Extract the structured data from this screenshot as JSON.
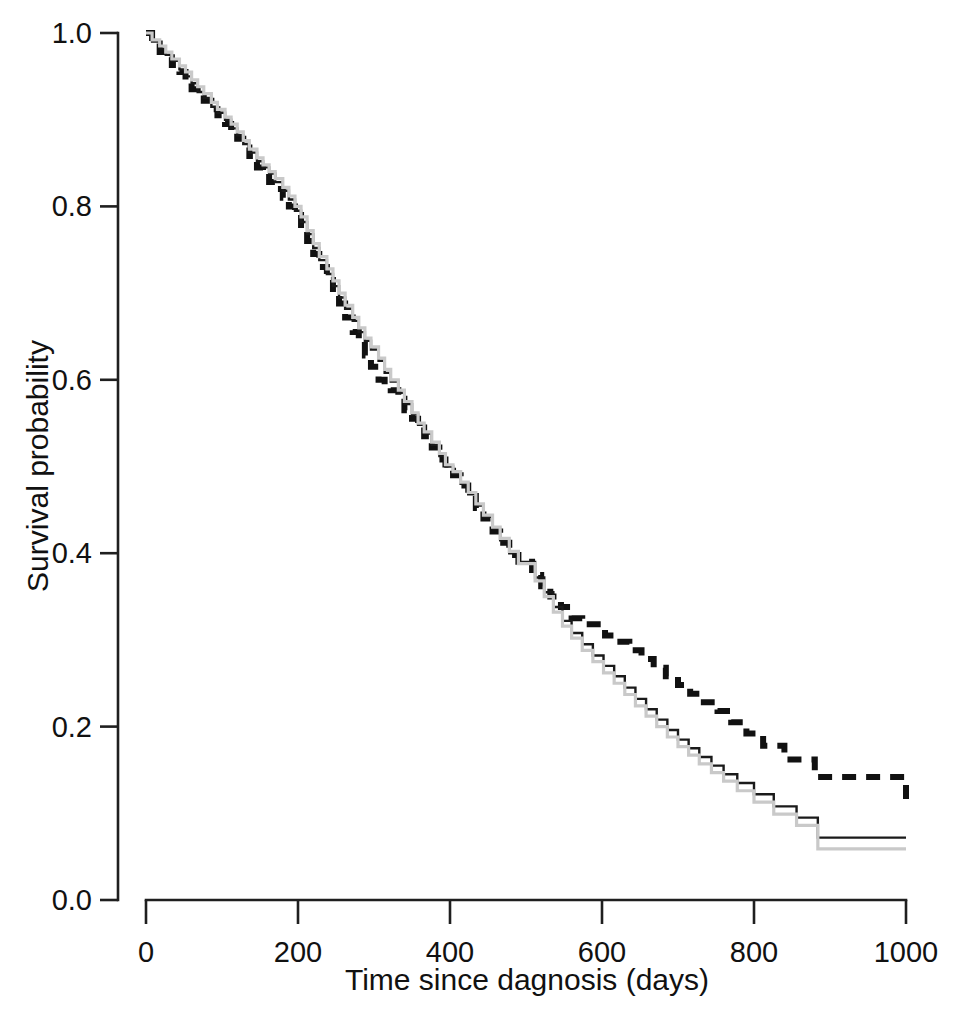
{
  "chart_data": {
    "type": "line",
    "title": "",
    "subtitle": "",
    "xlabel": "Time since dagnosis (days)",
    "ylabel": "Survival probability",
    "xlim": [
      0,
      1000
    ],
    "ylim": [
      0.0,
      1.0
    ],
    "xticks": [
      0,
      200,
      400,
      600,
      800,
      1000
    ],
    "xtick_labels": [
      "0",
      "200",
      "400",
      "600",
      "800",
      "1000"
    ],
    "yticks": [
      0.0,
      0.2,
      0.4,
      0.6,
      0.8,
      1.0
    ],
    "ytick_labels": [
      "0.0",
      "0.2",
      "0.4",
      "0.6",
      "0.8",
      "1.0"
    ],
    "grid": false,
    "legend": null,
    "legend_position": "none",
    "step_type": "post",
    "annotations": [],
    "series": [
      {
        "name": "black-dashed-curve",
        "style": "dashed",
        "color": "#111111",
        "line_width": 6,
        "dash_pattern": "14 10",
        "final_value": 0.113,
        "x": [
          0,
          8,
          18,
          26,
          34,
          44,
          52,
          60,
          68,
          76,
          86,
          94,
          104,
          112,
          120,
          128,
          136,
          146,
          154,
          162,
          170,
          180,
          188,
          196,
          204,
          212,
          220,
          228,
          238,
          246,
          254,
          262,
          272,
          280,
          288,
          296,
          306,
          314,
          322,
          332,
          340,
          350,
          358,
          366,
          376,
          386,
          394,
          404,
          414,
          424,
          434,
          444,
          456,
          466,
          478,
          490,
          504,
          508,
          520,
          532,
          546,
          560,
          574,
          590,
          604,
          620,
          636,
          652,
          668,
          684,
          700,
          716,
          734,
          752,
          770,
          790,
          812,
          840,
          880,
          1000
        ],
        "y": [
          1.0,
          0.988,
          0.978,
          0.972,
          0.963,
          0.955,
          0.945,
          0.935,
          0.928,
          0.922,
          0.912,
          0.905,
          0.895,
          0.885,
          0.878,
          0.868,
          0.858,
          0.845,
          0.838,
          0.828,
          0.82,
          0.81,
          0.8,
          0.79,
          0.775,
          0.76,
          0.745,
          0.73,
          0.715,
          0.7,
          0.688,
          0.672,
          0.655,
          0.64,
          0.628,
          0.615,
          0.6,
          0.592,
          0.588,
          0.578,
          0.565,
          0.555,
          0.545,
          0.535,
          0.522,
          0.508,
          0.495,
          0.49,
          0.478,
          0.466,
          0.452,
          0.44,
          0.425,
          0.412,
          0.398,
          0.39,
          0.39,
          0.375,
          0.362,
          0.35,
          0.338,
          0.325,
          0.318,
          0.318,
          0.305,
          0.298,
          0.288,
          0.278,
          0.268,
          0.258,
          0.248,
          0.238,
          0.228,
          0.218,
          0.205,
          0.192,
          0.178,
          0.162,
          0.142,
          0.113
        ]
      },
      {
        "name": "black-solid-curve",
        "style": "solid",
        "color": "#1a1a1a",
        "line_width": 2.4,
        "dash_pattern": null,
        "final_value": 0.072,
        "x": [
          0,
          8,
          18,
          26,
          34,
          44,
          52,
          60,
          68,
          76,
          86,
          94,
          104,
          112,
          120,
          128,
          136,
          146,
          154,
          162,
          170,
          180,
          188,
          196,
          204,
          212,
          220,
          228,
          238,
          246,
          254,
          262,
          272,
          280,
          288,
          296,
          306,
          314,
          322,
          332,
          340,
          350,
          358,
          366,
          376,
          386,
          394,
          404,
          414,
          424,
          434,
          444,
          456,
          466,
          478,
          490,
          504,
          512,
          524,
          536,
          548,
          560,
          574,
          588,
          602,
          616,
          630,
          644,
          658,
          672,
          686,
          700,
          714,
          728,
          744,
          760,
          778,
          800,
          826,
          856,
          884,
          1000
        ],
        "y": [
          1.0,
          0.99,
          0.982,
          0.975,
          0.968,
          0.958,
          0.95,
          0.942,
          0.932,
          0.925,
          0.915,
          0.908,
          0.9,
          0.89,
          0.882,
          0.872,
          0.862,
          0.852,
          0.845,
          0.838,
          0.828,
          0.818,
          0.808,
          0.795,
          0.782,
          0.768,
          0.752,
          0.738,
          0.722,
          0.708,
          0.695,
          0.682,
          0.668,
          0.655,
          0.645,
          0.635,
          0.622,
          0.608,
          0.598,
          0.585,
          0.572,
          0.56,
          0.548,
          0.538,
          0.525,
          0.512,
          0.5,
          0.492,
          0.48,
          0.468,
          0.455,
          0.442,
          0.428,
          0.415,
          0.4,
          0.39,
          0.39,
          0.372,
          0.355,
          0.338,
          0.322,
          0.308,
          0.295,
          0.282,
          0.27,
          0.258,
          0.245,
          0.232,
          0.22,
          0.208,
          0.196,
          0.185,
          0.175,
          0.165,
          0.155,
          0.145,
          0.135,
          0.122,
          0.108,
          0.095,
          0.072,
          0.072
        ]
      },
      {
        "name": "gray-curve",
        "style": "solid",
        "color": "#c9c9c9",
        "line_width": 3.2,
        "dash_pattern": null,
        "final_value": 0.059,
        "x": [
          0,
          8,
          18,
          26,
          34,
          44,
          52,
          60,
          68,
          76,
          86,
          94,
          104,
          112,
          120,
          128,
          136,
          146,
          154,
          162,
          170,
          180,
          188,
          196,
          204,
          212,
          220,
          228,
          238,
          246,
          254,
          262,
          272,
          280,
          288,
          296,
          306,
          314,
          322,
          332,
          340,
          350,
          358,
          366,
          376,
          386,
          394,
          404,
          414,
          424,
          434,
          444,
          456,
          466,
          478,
          490,
          504,
          512,
          524,
          536,
          548,
          560,
          574,
          588,
          602,
          616,
          630,
          644,
          658,
          672,
          686,
          700,
          714,
          728,
          744,
          760,
          778,
          800,
          826,
          856,
          884,
          1000
        ],
        "y": [
          1.0,
          0.992,
          0.985,
          0.978,
          0.97,
          0.962,
          0.955,
          0.946,
          0.938,
          0.93,
          0.92,
          0.912,
          0.903,
          0.895,
          0.886,
          0.876,
          0.866,
          0.856,
          0.848,
          0.84,
          0.832,
          0.822,
          0.812,
          0.8,
          0.788,
          0.772,
          0.757,
          0.742,
          0.728,
          0.714,
          0.7,
          0.686,
          0.672,
          0.66,
          0.648,
          0.638,
          0.625,
          0.612,
          0.6,
          0.588,
          0.575,
          0.562,
          0.55,
          0.54,
          0.528,
          0.515,
          0.502,
          0.494,
          0.482,
          0.47,
          0.457,
          0.444,
          0.43,
          0.417,
          0.402,
          0.388,
          0.388,
          0.368,
          0.35,
          0.332,
          0.316,
          0.302,
          0.288,
          0.275,
          0.262,
          0.25,
          0.237,
          0.224,
          0.212,
          0.2,
          0.188,
          0.177,
          0.167,
          0.157,
          0.147,
          0.137,
          0.126,
          0.113,
          0.099,
          0.086,
          0.059,
          0.059
        ]
      }
    ]
  },
  "axes": {
    "y_axis_title": "Survival probability",
    "x_axis_title": "Time since dagnosis (days)"
  },
  "caption": {
    "text": "partial caption line cropped at bottom of page"
  }
}
